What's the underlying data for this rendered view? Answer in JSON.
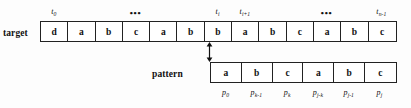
{
  "diagram": {
    "target": {
      "label": "target",
      "cells": [
        "d",
        "a",
        "b",
        "c",
        "a",
        "b",
        "b",
        "a",
        "b",
        "c",
        "a",
        "b",
        "c"
      ],
      "index_labels": [
        {
          "base": "t",
          "sub": "0",
          "cell_index": 0
        },
        {
          "base": "t",
          "sub": "i",
          "cell_index": 6
        },
        {
          "base": "t",
          "sub": "i+1",
          "cell_index": 7
        },
        {
          "base": "t",
          "sub": "n-1",
          "cell_index": 12
        }
      ],
      "ellipses": [
        {
          "text": "•••",
          "after_cell": 3
        },
        {
          "text": "•••",
          "after_cell": 10
        }
      ]
    },
    "pattern": {
      "label": "pattern",
      "cells": [
        "a",
        "b",
        "c",
        "a",
        "b",
        "c"
      ],
      "index_labels": [
        {
          "base": "p",
          "sub": "0",
          "cell_index": 0
        },
        {
          "base": "p",
          "sub": "k-1",
          "cell_index": 1
        },
        {
          "base": "p",
          "sub": "k",
          "cell_index": 2
        },
        {
          "base": "p",
          "sub": "j-k",
          "cell_index": 3
        },
        {
          "base": "p",
          "sub": "j-1",
          "cell_index": 4
        },
        {
          "base": "p",
          "sub": "j",
          "cell_index": 5
        }
      ]
    },
    "connector": {
      "name": "alignment-arrow",
      "style": "double-headed-vertical",
      "from_target_cell": 6,
      "to_pattern_cell": 0,
      "color": "#111111"
    },
    "colors": {
      "ink": "#111111",
      "border": "#222222",
      "cell_fill": "#ffffff",
      "background": "#fdfdfd"
    }
  }
}
